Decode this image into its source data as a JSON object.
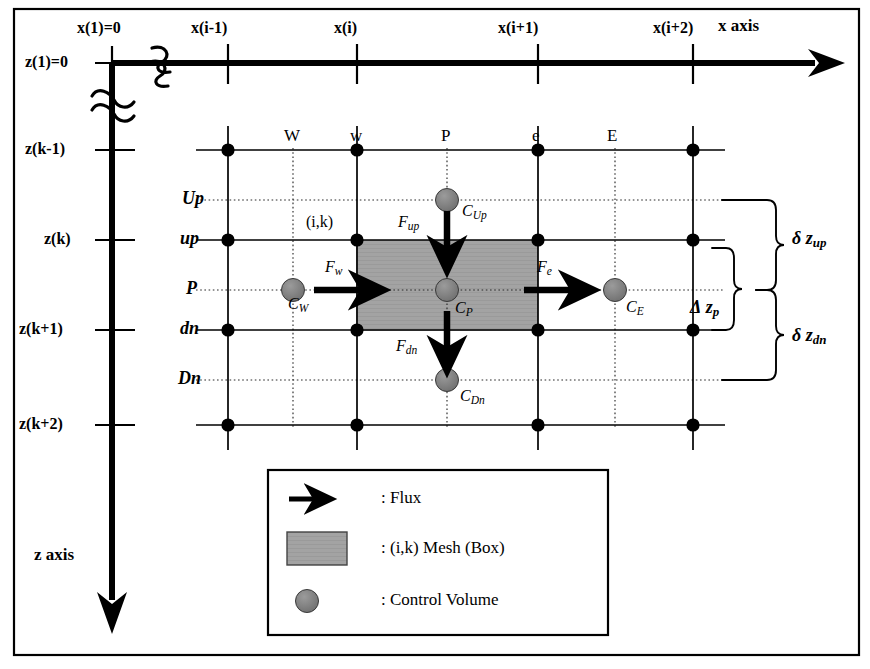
{
  "figure": {
    "colors": {
      "line": "#000000",
      "mesh_fill": "#a0a0a0",
      "control_volume_fill": "#707070",
      "frame": "#000000",
      "background": "#ffffff"
    }
  },
  "axes": {
    "x": {
      "label": "x  axis",
      "origin_label": "x(1)=0",
      "ticks": [
        "x(1)=0",
        "x(i-1)",
        "x(i)",
        "x(i+1)",
        "x(i+2)"
      ],
      "break_symbol": "≈"
    },
    "z": {
      "label": "z axis",
      "origin_label": "z(1)=0",
      "ticks": [
        "z(1)=0",
        "z(k-1)",
        "z(k)",
        "z(k+1)",
        "z(k+2)"
      ],
      "break_symbol": "≈"
    }
  },
  "columns": {
    "solid_labels": [
      "w",
      "P",
      "e"
    ],
    "dotted_labels": [
      "W",
      "E"
    ],
    "all_labels": [
      "W",
      "w",
      "P",
      "e",
      "E"
    ]
  },
  "rows": {
    "labels": [
      "Up",
      "up",
      "P",
      "dn",
      "Dn"
    ],
    "solid": [
      "up",
      "dn"
    ],
    "dotted": [
      "Up",
      "P",
      "Dn"
    ]
  },
  "mesh_cell": {
    "index_label": "(i,k)"
  },
  "fluxes": [
    {
      "name": "F_up",
      "base": "F",
      "sub": "up",
      "direction": "down"
    },
    {
      "name": "F_w",
      "base": "F",
      "sub": "w",
      "direction": "right"
    },
    {
      "name": "F_e",
      "base": "F",
      "sub": "e",
      "direction": "right"
    },
    {
      "name": "F_dn",
      "base": "F",
      "sub": "dn",
      "direction": "down"
    }
  ],
  "concentrations": [
    {
      "name": "C_Up",
      "base": "C",
      "sub": "Up"
    },
    {
      "name": "C_W",
      "base": "C",
      "sub": "W"
    },
    {
      "name": "C_P",
      "base": "C",
      "sub": "P"
    },
    {
      "name": "C_E",
      "base": "C",
      "sub": "E"
    },
    {
      "name": "C_Dn",
      "base": "C",
      "sub": "Dn"
    }
  ],
  "spacings": [
    {
      "name": "delta_z_up",
      "symbol": "δ",
      "base": "z",
      "sub": "up",
      "text": "δ z up"
    },
    {
      "name": "Delta_z_p",
      "symbol": "Δ",
      "base": "z",
      "sub": "p",
      "text": "Δ z p"
    },
    {
      "name": "delta_z_dn",
      "symbol": "δ",
      "base": "z",
      "sub": "dn",
      "text": "δ z dn"
    }
  ],
  "legend": {
    "items": [
      {
        "key": "flux",
        "glyph": "arrow-right",
        "text": ": Flux"
      },
      {
        "key": "mesh-box",
        "glyph": "gray-rect",
        "text": ": (i,k) Mesh (Box)"
      },
      {
        "key": "control-volume",
        "glyph": "gray-circle",
        "text": ": Control Volume"
      }
    ]
  }
}
